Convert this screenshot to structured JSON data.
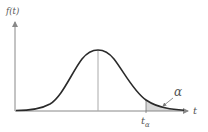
{
  "diagram": {
    "type": "normal-distribution-upper-tail",
    "y_axis_label": "f(t)",
    "x_axis_label": "t",
    "critical_value_label": "t",
    "critical_value_subscript": "α",
    "tail_area_label": "α",
    "colors": {
      "curve": "#2a2a2a",
      "axes": "#888888",
      "mean_line": "#aaaaaa",
      "tail_fill": "#d8d8d8",
      "text": "#555555"
    }
  }
}
